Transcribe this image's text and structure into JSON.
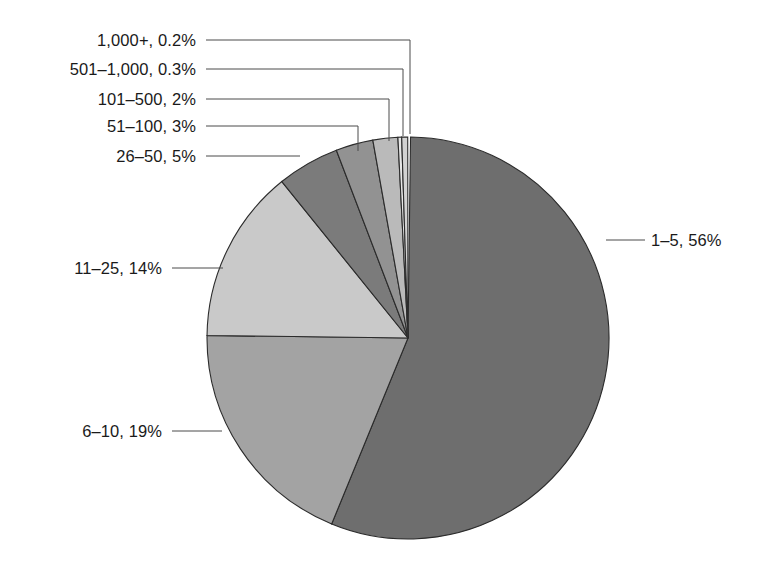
{
  "chart_data": {
    "type": "pie",
    "title": "",
    "subtitle": "",
    "xlabel": "",
    "ylabel": "",
    "legend_position": "none",
    "grid": false,
    "label_format": "category, percent",
    "start_angle_deg": 0,
    "direction": "clockwise",
    "categories": [
      "1–5",
      "6–10",
      "11–25",
      "26–50",
      "51–100",
      "101–500",
      "501–1,000",
      "1,000+"
    ],
    "values": [
      56,
      19,
      14,
      5,
      3,
      2,
      0.3,
      0.2
    ],
    "value_labels": [
      "56%",
      "19%",
      "14%",
      "5%",
      "3%",
      "2%",
      "0.3%",
      "0.2%"
    ],
    "colors": [
      "#6e6e6e",
      "#a3a3a3",
      "#c9c9c9",
      "#7b7b7b",
      "#929292",
      "#bababa",
      "#e6e6e6",
      "#d2d2d2"
    ],
    "slices": [
      {
        "id": "slice-1-5",
        "category": "1–5",
        "value": 56,
        "value_label": "56%",
        "label": "1–5, 56%",
        "color": "#6e6e6e",
        "label_anchor": "start",
        "label_x": 651,
        "label_y": 246,
        "leader_path": "M 606 240 L 645 240",
        "start_angle": 0.72,
        "end_angle": 202.32
      },
      {
        "id": "slice-6-10",
        "category": "6–10",
        "value": 19,
        "value_label": "19%",
        "label": "6–10, 19%",
        "color": "#a3a3a3",
        "label_anchor": "end",
        "label_x": 162,
        "label_y": 437,
        "leader_path": "M 172 431 L 222 431",
        "start_angle": 202.32,
        "end_angle": 270.72
      },
      {
        "id": "slice-11-25",
        "category": "11–25",
        "value": 14,
        "value_label": "14%",
        "label": "11–25, 14%",
        "color": "#c9c9c9",
        "label_anchor": "end",
        "label_x": 162,
        "label_y": 274,
        "leader_path": "M 172 268 L 223 268",
        "start_angle": 270.72,
        "end_angle": 321.12
      },
      {
        "id": "slice-26-50",
        "category": "26–50",
        "value": 5,
        "value_label": "5%",
        "label": "26–50, 5%",
        "color": "#7b7b7b",
        "label_anchor": "end",
        "label_x": 196,
        "label_y": 162,
        "leader_path": "M 206 156 L 300 156",
        "start_angle": 321.12,
        "end_angle": 339.12
      },
      {
        "id": "slice-51-100",
        "category": "51–100",
        "value": 3,
        "value_label": "3%",
        "label": "51–100, 3%",
        "color": "#929292",
        "label_anchor": "end",
        "label_x": 196,
        "label_y": 132,
        "leader_path": "M 206 126 L 358 126 L 358 151",
        "start_angle": 339.12,
        "end_angle": 349.92
      },
      {
        "id": "slice-101-500",
        "category": "101–500",
        "value": 2,
        "value_label": "2%",
        "label": "101–500, 2%",
        "color": "#bababa",
        "label_anchor": "end",
        "label_x": 196,
        "label_y": 105,
        "leader_path": "M 206 99 L 389 99 L 389 141",
        "start_angle": 349.92,
        "end_angle": 357.12
      },
      {
        "id": "slice-501-1000",
        "category": "501–1,000",
        "value": 0.3,
        "value_label": "0.3%",
        "label": "501–1,000, 0.3%",
        "color": "#e6e6e6",
        "label_anchor": "end",
        "label_x": 196,
        "label_y": 75,
        "leader_path": "M 206 69 L 403 69 L 403 136",
        "start_angle": 357.12,
        "end_angle": 358.2
      },
      {
        "id": "slice-1000plus",
        "category": "1,000+",
        "value": 0.2,
        "value_label": "0.2%",
        "label": "1,000+, 0.2%",
        "color": "#d2d2d2",
        "label_anchor": "end",
        "label_x": 196,
        "label_y": 46,
        "leader_path": "M 206 40 L 410 40 L 410 134",
        "start_angle": 358.2,
        "end_angle": 359.92
      }
    ],
    "geometry": {
      "center_x": 408,
      "center_y": 338,
      "radius": 201
    }
  }
}
